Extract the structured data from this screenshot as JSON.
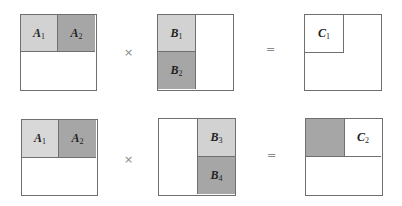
{
  "colors": {
    "light": "#d2d2d2",
    "dark": "#a6a6a6",
    "border": "#6f6f6f",
    "white": "#ffffff"
  },
  "operators": {
    "times": "×",
    "equals": "="
  },
  "rows": [
    {
      "a": {
        "blocks": [
          {
            "name": "A",
            "sub": "1"
          },
          {
            "name": "A",
            "sub": "2"
          }
        ]
      },
      "b": {
        "blocks": [
          {
            "name": "B",
            "sub": "1"
          },
          {
            "name": "B",
            "sub": "2"
          }
        ]
      },
      "c": {
        "blocks": [
          {
            "name": "C",
            "sub": "1"
          }
        ]
      }
    },
    {
      "a": {
        "blocks": [
          {
            "name": "A",
            "sub": "1"
          },
          {
            "name": "A",
            "sub": "2"
          }
        ]
      },
      "b": {
        "blocks": [
          {
            "name": "B",
            "sub": "3"
          },
          {
            "name": "B",
            "sub": "4"
          }
        ]
      },
      "c": {
        "blocks": [
          {
            "name": "C",
            "sub": "2"
          }
        ]
      }
    }
  ]
}
